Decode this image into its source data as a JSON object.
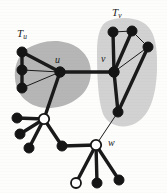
{
  "figure": {
    "width": 167,
    "height": 193,
    "background": "#fdfdfc"
  },
  "labels": {
    "tree_u": "T",
    "tree_u_sub": "u",
    "tree_v": "T",
    "tree_v_sub": "v",
    "node_u": "u",
    "node_v": "v",
    "node_w": "w"
  },
  "colors": {
    "blob_u": "#b6b6b6",
    "blob_v": "#d2d2d2",
    "edge": "#1a1a1a",
    "node_fill_black": "#151515",
    "node_fill_white": "#ffffff",
    "node_stroke": "#151515",
    "text": "#1c1c1c"
  },
  "chart_data": {
    "type": "diagram",
    "regions": [
      {
        "id": "blob-Tu",
        "label": "T_u",
        "fill": "#b6b6b6",
        "label_x": 17,
        "label_y": 28,
        "path": "M 30 47 C 22 50, 14 62, 15 78 C 16 96, 30 108, 48 108 C 66 108, 86 98, 90 80 C 94 62, 84 48, 68 43 C 52 38, 38 43, 30 47 Z"
      },
      {
        "id": "blob-Tv",
        "label": "T_v",
        "fill": "#d2d2d2",
        "label_x": 112,
        "label_y": 7,
        "path": "M 108 21 C 100 24, 97 36, 97 52 C 97 76, 98 100, 103 114 C 108 126, 124 130, 136 123 C 150 115, 156 96, 157 70 C 158 44, 154 28, 142 22 C 130 16, 116 18, 108 21 Z"
      }
    ],
    "nodes": [
      {
        "id": "tu1",
        "x": 22,
        "y": 52,
        "fill": "black",
        "r": 5.0
      },
      {
        "id": "tu2",
        "x": 22,
        "y": 70,
        "fill": "black",
        "r": 5.0
      },
      {
        "id": "tu3",
        "x": 22,
        "y": 88,
        "fill": "black",
        "r": 5.0
      },
      {
        "id": "u",
        "x": 60,
        "y": 72,
        "fill": "black",
        "r": 5.2
      },
      {
        "id": "v",
        "x": 114,
        "y": 72,
        "fill": "black",
        "r": 5.2
      },
      {
        "id": "tv1",
        "x": 113,
        "y": 32,
        "fill": "black",
        "r": 5.0
      },
      {
        "id": "tv2",
        "x": 132,
        "y": 31,
        "fill": "black",
        "r": 5.0
      },
      {
        "id": "tv3",
        "x": 148,
        "y": 47,
        "fill": "black",
        "r": 5.0
      },
      {
        "id": "tv4",
        "x": 118,
        "y": 112,
        "fill": "black",
        "r": 5.0
      },
      {
        "id": "c1",
        "x": 44,
        "y": 119,
        "fill": "white",
        "r": 5.2
      },
      {
        "id": "c1a",
        "x": 17,
        "y": 118,
        "fill": "black",
        "r": 5.0
      },
      {
        "id": "c1b",
        "x": 20,
        "y": 134,
        "fill": "black",
        "r": 5.0
      },
      {
        "id": "c1c",
        "x": 29,
        "y": 148,
        "fill": "black",
        "r": 5.0
      },
      {
        "id": "c2",
        "x": 62,
        "y": 146,
        "fill": "black",
        "r": 5.0
      },
      {
        "id": "w",
        "x": 96,
        "y": 145,
        "fill": "white",
        "r": 5.2
      },
      {
        "id": "w1",
        "x": 76,
        "y": 183,
        "fill": "white",
        "r": 5.0
      },
      {
        "id": "w2",
        "x": 97,
        "y": 183,
        "fill": "black",
        "r": 5.0
      },
      {
        "id": "w3",
        "x": 119,
        "y": 180,
        "fill": "black",
        "r": 5.0
      }
    ],
    "edges": [
      {
        "from": "tu1",
        "to": "tu2",
        "weight": "thick"
      },
      {
        "from": "tu2",
        "to": "tu3",
        "weight": "thick"
      },
      {
        "from": "tu1",
        "to": "u",
        "weight": "thick"
      },
      {
        "from": "tu2",
        "to": "u",
        "weight": "thin"
      },
      {
        "from": "tu3",
        "to": "u",
        "weight": "thin"
      },
      {
        "from": "u",
        "to": "v",
        "weight": "thick"
      },
      {
        "from": "v",
        "to": "tv1",
        "weight": "thick"
      },
      {
        "from": "tv1",
        "to": "tv2",
        "weight": "thin"
      },
      {
        "from": "v",
        "to": "tv2",
        "weight": "thick"
      },
      {
        "from": "tv2",
        "to": "tv3",
        "weight": "thin"
      },
      {
        "from": "v",
        "to": "tv3",
        "weight": "thin"
      },
      {
        "from": "v",
        "to": "tv4",
        "weight": "thick"
      },
      {
        "from": "tv3",
        "to": "tv4",
        "weight": "thick"
      },
      {
        "from": "u",
        "to": "c1",
        "weight": "thick"
      },
      {
        "from": "c1",
        "to": "c1a",
        "weight": "thick"
      },
      {
        "from": "c1",
        "to": "c1b",
        "weight": "thick"
      },
      {
        "from": "c1",
        "to": "c1c",
        "weight": "thick"
      },
      {
        "from": "c1",
        "to": "c2",
        "weight": "thick"
      },
      {
        "from": "c2",
        "to": "w",
        "weight": "thick"
      },
      {
        "from": "tv4",
        "to": "w",
        "weight": "thin"
      },
      {
        "from": "w",
        "to": "w1",
        "weight": "thick"
      },
      {
        "from": "w",
        "to": "w2",
        "weight": "thick"
      },
      {
        "from": "w",
        "to": "w3",
        "weight": "thick"
      }
    ]
  }
}
